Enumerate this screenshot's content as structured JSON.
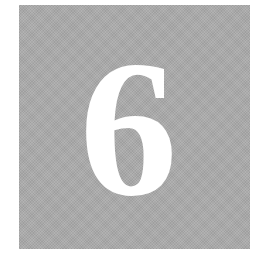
{
  "tile": {
    "numeral": "6",
    "background_color": "#a9a9a9",
    "numeral_color": "#ffffff"
  }
}
